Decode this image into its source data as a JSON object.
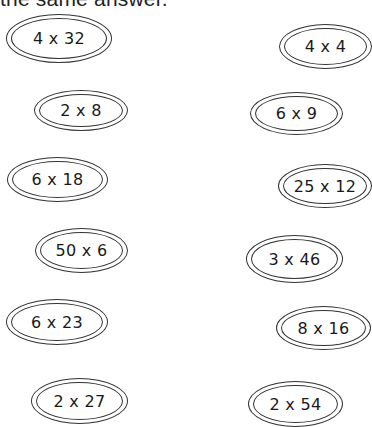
{
  "header": {
    "text": "the same answer."
  },
  "ovals": [
    {
      "expression": "4 x 32",
      "x": 6,
      "y": 14,
      "w": 106,
      "h": 49
    },
    {
      "expression": "4 x 4",
      "x": 279,
      "y": 24,
      "w": 93,
      "h": 45
    },
    {
      "expression": "2 x 8",
      "x": 34,
      "y": 90,
      "w": 94,
      "h": 41
    },
    {
      "expression": "6 x 9",
      "x": 250,
      "y": 92,
      "w": 93,
      "h": 43
    },
    {
      "expression": "6 x 18",
      "x": 7,
      "y": 157,
      "w": 101,
      "h": 45
    },
    {
      "expression": "25 x 12",
      "x": 278,
      "y": 164,
      "w": 94,
      "h": 44
    },
    {
      "expression": "50 x 6",
      "x": 35,
      "y": 228,
      "w": 93,
      "h": 45
    },
    {
      "expression": "3 x 46",
      "x": 246,
      "y": 235,
      "w": 97,
      "h": 48
    },
    {
      "expression": "6 x 23",
      "x": 6,
      "y": 299,
      "w": 102,
      "h": 46
    },
    {
      "expression": "8 x 16",
      "x": 276,
      "y": 306,
      "w": 95,
      "h": 44
    },
    {
      "expression": "2 x 27",
      "x": 31,
      "y": 378,
      "w": 97,
      "h": 46
    },
    {
      "expression": "2 x 54",
      "x": 248,
      "y": 381,
      "w": 95,
      "h": 46
    }
  ]
}
